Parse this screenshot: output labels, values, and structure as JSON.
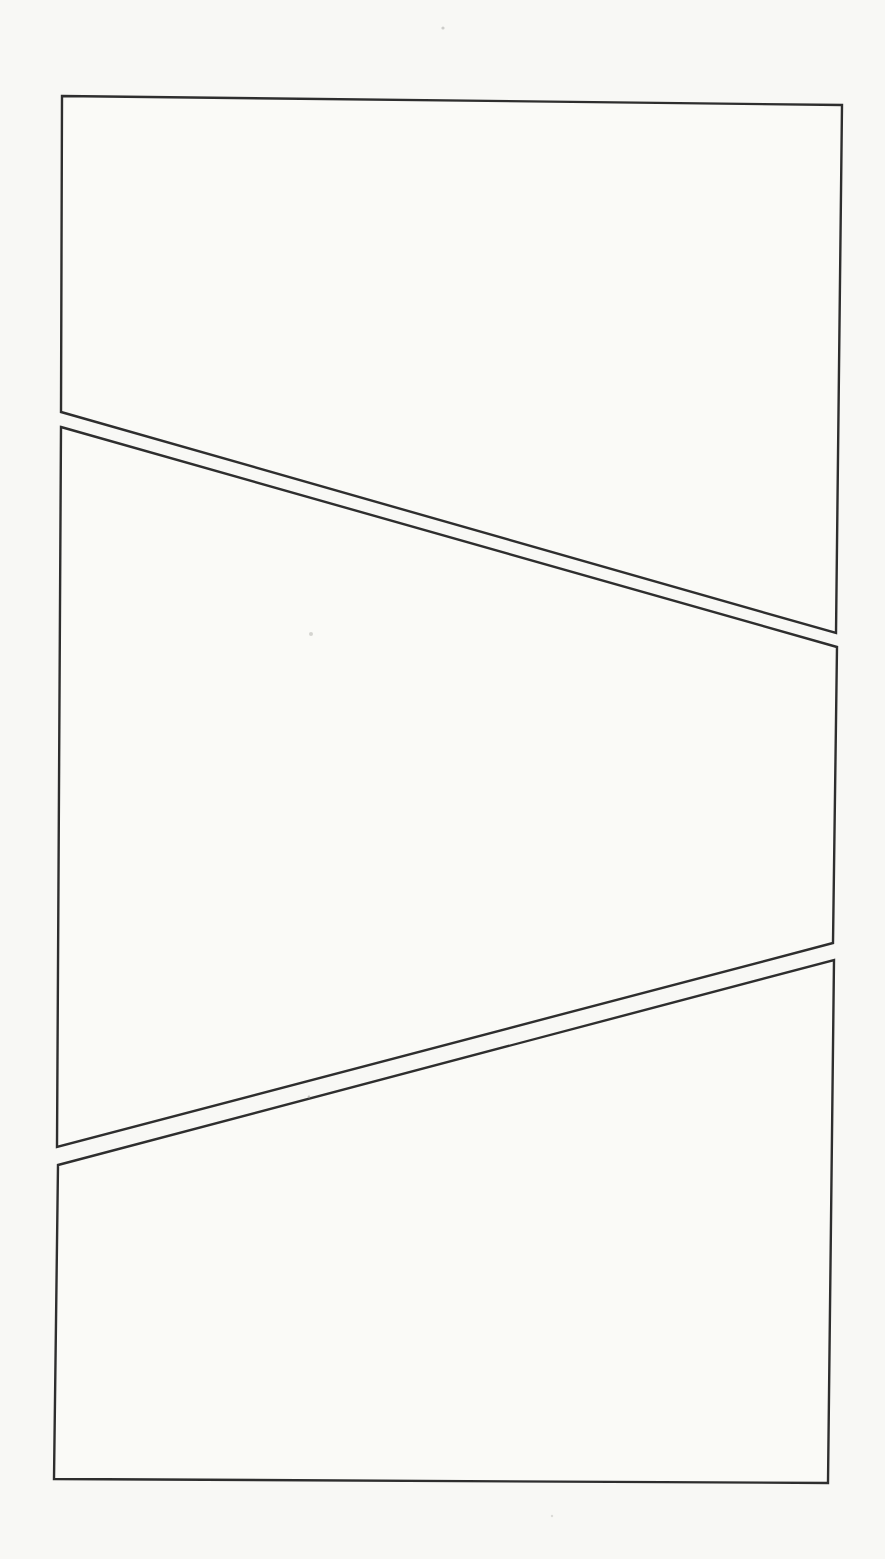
{
  "canvas": {
    "width": 885,
    "height": 1559,
    "description": "Scanned blank page with three empty comic-style panels separated by diagonal gutters"
  },
  "style": {
    "paper_color": "#f8f8f5",
    "panel_fill": "#fafaf7",
    "line_color": "#2e2e2e",
    "stroke_width": 2.4,
    "speck_color": "#9a9a96"
  },
  "panels": [
    {
      "name": "panel-top",
      "points": [
        [
          62,
          96
        ],
        [
          842,
          105
        ],
        [
          836,
          633
        ],
        [
          61,
          412
        ]
      ]
    },
    {
      "name": "panel-middle",
      "points": [
        [
          61,
          427
        ],
        [
          837,
          647
        ],
        [
          833,
          943
        ],
        [
          57,
          1147
        ]
      ]
    },
    {
      "name": "panel-bottom",
      "points": [
        [
          58,
          1165
        ],
        [
          834,
          960
        ],
        [
          828,
          1483
        ],
        [
          54,
          1479
        ]
      ]
    }
  ],
  "specks": [
    {
      "x": 443,
      "y": 28,
      "r": 1.6,
      "opacity": 0.45
    },
    {
      "x": 311,
      "y": 634,
      "r": 2.0,
      "opacity": 0.4
    },
    {
      "x": 309,
      "y": 1097,
      "r": 1.4,
      "opacity": 0.55
    },
    {
      "x": 552,
      "y": 1516,
      "r": 1.2,
      "opacity": 0.3
    }
  ]
}
